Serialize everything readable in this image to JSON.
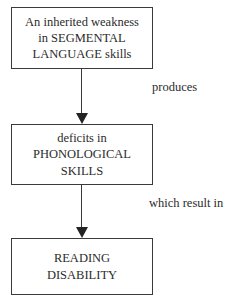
{
  "diagram": {
    "type": "flowchart",
    "orientation": "vertical",
    "title": "",
    "background_color": "#ffffff",
    "text_color": "#2b2b2b",
    "border_color": "#3a3a3a",
    "nodes": [
      {
        "id": "weakness",
        "shape": "rectangle",
        "lines": [
          "An inherited weakness",
          "in SEGMENTAL",
          "LANGUAGE skills"
        ]
      },
      {
        "id": "phonological",
        "shape": "rectangle",
        "lines": [
          "deficits in",
          "PHONOLOGICAL",
          "SKILLS"
        ]
      },
      {
        "id": "reading",
        "shape": "rectangle",
        "lines": [
          "READING",
          "DISABILITY"
        ]
      }
    ],
    "edges": [
      {
        "id": "weakness-to-phonological",
        "from": "weakness",
        "to": "phonological",
        "label": "produces",
        "arrowhead": "filled-triangle"
      },
      {
        "id": "phonological-to-reading",
        "from": "phonological",
        "to": "reading",
        "label": "which result in",
        "arrowhead": "filled-triangle"
      }
    ]
  }
}
